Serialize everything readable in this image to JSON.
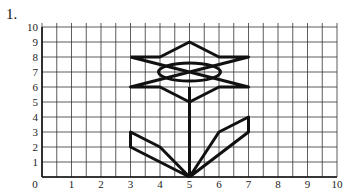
{
  "problem_number": "1.",
  "grid": {
    "x_min": 0,
    "x_max": 10,
    "y_min": 0,
    "y_max": 10,
    "x_tick_labels": [
      "0",
      "1",
      "2",
      "3",
      "4",
      "5",
      "6",
      "7",
      "8",
      "9",
      "10"
    ],
    "y_tick_labels": [
      "0",
      "1",
      "2",
      "3",
      "4",
      "5",
      "6",
      "7",
      "8",
      "9",
      "10"
    ],
    "minor_step_x": 0.5
  },
  "figure": {
    "name": "flower",
    "star_outline": [
      [
        3,
        8
      ],
      [
        4,
        8
      ],
      [
        5,
        9
      ],
      [
        6,
        8
      ],
      [
        7,
        8
      ],
      [
        3,
        6
      ],
      [
        4,
        6
      ],
      [
        5,
        5
      ],
      [
        6,
        6
      ],
      [
        7,
        6
      ],
      [
        3,
        8
      ]
    ],
    "ellipse": {
      "cx": 5,
      "cy": 7,
      "rx": 1.05,
      "ry": 0.6
    },
    "stem": [
      [
        5,
        0
      ],
      [
        5,
        6
      ]
    ],
    "left_leaf": [
      [
        5,
        0
      ],
      [
        3,
        2
      ],
      [
        3,
        3
      ],
      [
        4,
        2
      ],
      [
        5,
        0
      ]
    ],
    "right_leaf": [
      [
        5,
        0
      ],
      [
        6,
        3
      ],
      [
        7,
        4
      ],
      [
        7,
        3
      ],
      [
        5,
        0
      ]
    ],
    "stroke_color": "#111111"
  }
}
